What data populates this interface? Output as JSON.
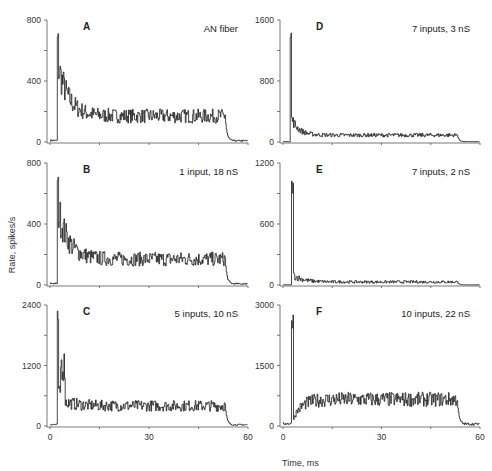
{
  "figure": {
    "ylabel": "Rate, spikes/s",
    "xlabel": "Time, ms"
  },
  "chart_data": [
    {
      "type": "line",
      "panel": "A",
      "title": "AN fiber",
      "xlabel": "Time, ms",
      "ylabel": "Rate, spikes/s",
      "xlim": [
        0,
        60
      ],
      "ylim": [
        0,
        800
      ],
      "yticks": [
        0,
        400,
        800
      ],
      "xticks": [
        0,
        30,
        60
      ],
      "description": "onset peak ~730 at 2 ms, decays to ~170 by 10 ms, sustained ~170 until ~53 ms, then ~10",
      "onset_ms": 2,
      "peak": 730,
      "sustained": 170,
      "offset_ms": 53,
      "spont": 10
    },
    {
      "type": "line",
      "panel": "B",
      "title": "1 input, 18 nS",
      "xlabel": "Time, ms",
      "ylabel": "Rate, spikes/s",
      "xlim": [
        0,
        60
      ],
      "ylim": [
        0,
        800
      ],
      "yticks": [
        0,
        400,
        800
      ],
      "xticks": [
        0,
        30,
        60
      ],
      "onset_ms": 2,
      "peak": 720,
      "sustained": 170,
      "offset_ms": 53,
      "spont": 10
    },
    {
      "type": "line",
      "panel": "C",
      "title": "5 inputs, 10 nS",
      "xlabel": "Time, ms",
      "ylabel": "Rate, spikes/s",
      "xlim": [
        0,
        60
      ],
      "ylim": [
        0,
        2400
      ],
      "yticks": [
        0,
        1200,
        2400
      ],
      "xticks": [
        0,
        30,
        60
      ],
      "onset_ms": 2,
      "peak": 2300,
      "sustained": 400,
      "offset_ms": 53,
      "spont": 30
    },
    {
      "type": "line",
      "panel": "D",
      "title": "7 inputs, 3 nS",
      "xlabel": "Time, ms",
      "ylabel": "Rate, spikes/s",
      "xlim": [
        0,
        60
      ],
      "ylim": [
        0,
        1600
      ],
      "yticks": [
        0,
        800,
        1600
      ],
      "xticks": [
        0,
        30,
        60
      ],
      "onset_ms": 2,
      "peak": 1500,
      "sustained": 90,
      "offset_ms": 53,
      "spont": 5
    },
    {
      "type": "line",
      "panel": "E",
      "title": "7 inputs, 2 nS",
      "xlabel": "Time, ms",
      "ylabel": "Rate, spikes/s",
      "xlim": [
        0,
        60
      ],
      "ylim": [
        0,
        1200
      ],
      "yticks": [
        0,
        600,
        1200
      ],
      "xticks": [
        0,
        30,
        60
      ],
      "onset_ms": 2.5,
      "peak": 1050,
      "sustained": 30,
      "offset_ms": 53,
      "spont": 2
    },
    {
      "type": "line",
      "panel": "F",
      "title": "10 inputs, 22 nS",
      "xlabel": "Time, ms",
      "ylabel": "Rate, spikes/s",
      "xlim": [
        0,
        60
      ],
      "ylim": [
        0,
        3000
      ],
      "yticks": [
        0,
        1500,
        3000
      ],
      "xticks": [
        0,
        30,
        60
      ],
      "onset_ms": 2.5,
      "peak": 2850,
      "sustained": 600,
      "offset_ms": 53,
      "spont": 60
    }
  ],
  "panels": [
    {
      "letter": "A",
      "note": "AN fiber",
      "yticks": [
        "0",
        "400",
        "800"
      ],
      "xticks": [
        "",
        "",
        ""
      ]
    },
    {
      "letter": "B",
      "note": "1 input, 18 nS",
      "yticks": [
        "0",
        "400",
        "800"
      ],
      "xticks": [
        "",
        "",
        ""
      ]
    },
    {
      "letter": "C",
      "note": "5 inputs, 10 nS",
      "yticks": [
        "0",
        "1200",
        "2400"
      ],
      "xticks": [
        "0",
        "30",
        "60"
      ]
    },
    {
      "letter": "D",
      "note": "7 inputs, 3 nS",
      "yticks": [
        "0",
        "800",
        "1600"
      ],
      "xticks": [
        "",
        "",
        ""
      ]
    },
    {
      "letter": "E",
      "note": "7 inputs, 2 nS",
      "yticks": [
        "0",
        "600",
        "1200"
      ],
      "xticks": [
        "",
        "",
        ""
      ]
    },
    {
      "letter": "F",
      "note": "10 inputs, 22 nS",
      "yticks": [
        "0",
        "1500",
        "3000"
      ],
      "xticks": [
        "0",
        "30",
        "60"
      ]
    }
  ]
}
